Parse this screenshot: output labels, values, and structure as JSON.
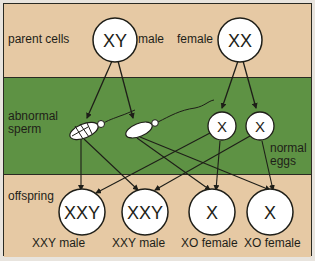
{
  "diagram": {
    "rows": {
      "parents": "parent cells",
      "sperm": [
        "abnormal",
        "sperm"
      ],
      "offspring": "offspring"
    },
    "parents": {
      "male": {
        "genotype": "XY",
        "label": "male"
      },
      "female": {
        "genotype": "XX",
        "label": "female"
      }
    },
    "gametes": {
      "eggs": {
        "genotype": "X",
        "count": 2
      },
      "eggs_label": [
        "normal",
        "eggs"
      ]
    },
    "offspring": [
      {
        "genotype": "XXY",
        "label": "XXY male"
      },
      {
        "genotype": "XXY",
        "label": "XXY male"
      },
      {
        "genotype": "X",
        "label": "XO female"
      },
      {
        "genotype": "X",
        "label": "XO female"
      }
    ],
    "colors": {
      "tan": "#e6c9a4",
      "green": "#5e9244",
      "ink": "#1e1e18",
      "circle_fill": "#ffffff"
    }
  }
}
